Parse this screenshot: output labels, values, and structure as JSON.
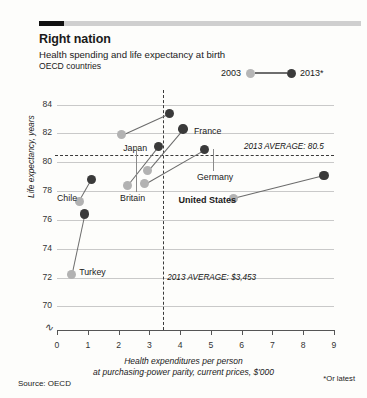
{
  "header": {
    "title": "Right nation",
    "subtitle": "Health spending and life expectancy at birth",
    "subtitle2": "OECD countries"
  },
  "legend": {
    "first_label": "2003",
    "second_label": "2013*",
    "first_color": "#b2b2b2",
    "second_color": "#3a3a3a"
  },
  "annotations": {
    "horizontal_average": "2013 AVERAGE: 80.5",
    "vertical_average": "2013 AVERAGE: $3,453"
  },
  "footer": {
    "source": "Source: OECD",
    "note": "*Or latest"
  },
  "chart_data": {
    "type": "scatter",
    "title": "Right nation",
    "subtitle": "Health spending and life expectancy at birth",
    "xlabel": "Health expenditures per person at purchasing-power parity, current prices, $'000",
    "ylabel": "Life expectancy, years",
    "xlim": [
      0,
      9
    ],
    "ylim": [
      69.2,
      84.6
    ],
    "xticks": [
      0,
      1,
      2,
      3,
      4,
      5,
      6,
      7,
      8,
      9
    ],
    "yticks": [
      70,
      72,
      74,
      76,
      78,
      80,
      82,
      84
    ],
    "grid": "horizontal",
    "y_axis_break": true,
    "legend_position": "top-right",
    "reference_lines": [
      {
        "orientation": "horizontal",
        "value": 80.5,
        "label": "2013 AVERAGE: 80.5"
      },
      {
        "orientation": "vertical",
        "value": 3.453,
        "label": "2013 AVERAGE: $3,453"
      }
    ],
    "series": [
      {
        "name": "2003",
        "color": "#b2b2b2"
      },
      {
        "name": "2013*",
        "color": "#3a3a3a"
      }
    ],
    "points": [
      {
        "country": "Japan",
        "x2003": 2.1,
        "y2003": 81.9,
        "x2013": 3.65,
        "y2013": 83.4,
        "label_x": 2.15,
        "label_y": 81.0,
        "bold": false,
        "leader": false
      },
      {
        "country": "France",
        "x2003": 2.95,
        "y2003": 79.4,
        "x2013": 4.1,
        "y2013": 82.3,
        "label_x": 4.45,
        "label_y": 82.2,
        "bold": false,
        "leader": false
      },
      {
        "country": "Germany",
        "x2003": 2.85,
        "y2003": 78.5,
        "x2013": 4.8,
        "y2013": 80.9,
        "label_x": 4.55,
        "label_y": 79.0,
        "bold": false,
        "leader": true
      },
      {
        "country": "Britain",
        "x2003": 2.3,
        "y2003": 78.4,
        "x2013": 3.3,
        "y2013": 81.1,
        "label_x": 2.05,
        "label_y": 77.5,
        "bold": false,
        "leader": true
      },
      {
        "country": "Chile",
        "x2003": 0.72,
        "y2003": 77.3,
        "x2013": 1.12,
        "y2013": 78.8,
        "label_x": 0.0,
        "label_y": 77.5,
        "bold": false,
        "leader": false
      },
      {
        "country": "Turkey",
        "x2003": 0.48,
        "y2003": 72.2,
        "x2013": 0.9,
        "y2013": 76.4,
        "label_x": 0.72,
        "label_y": 72.4,
        "bold": false,
        "leader": false
      },
      {
        "country": "United States",
        "x2003": 5.72,
        "y2003": 77.5,
        "x2013": 8.68,
        "y2013": 79.1,
        "label_x": 3.95,
        "label_y": 77.4,
        "bold": true,
        "leader": false
      }
    ]
  }
}
